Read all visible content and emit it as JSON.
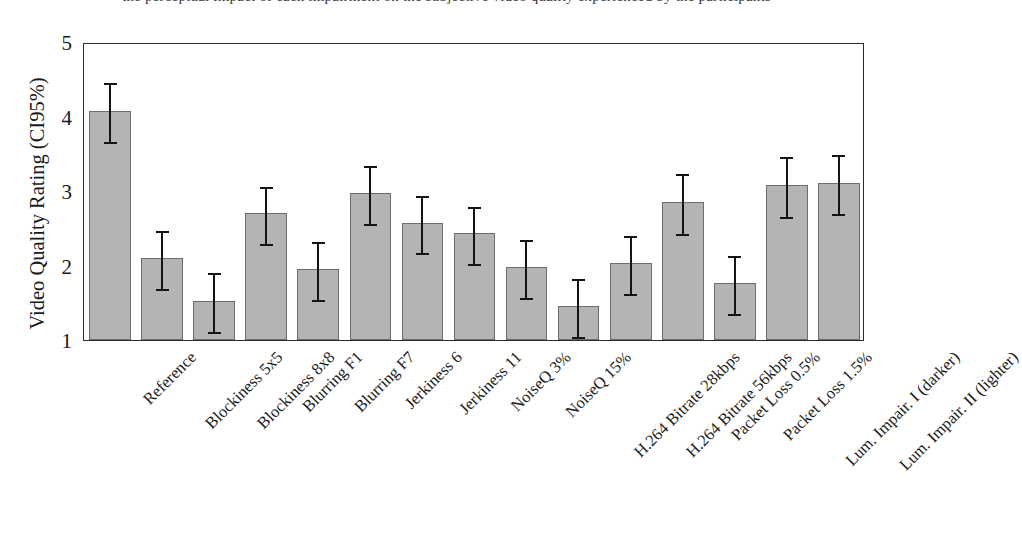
{
  "figure": {
    "top_clipped_caption": "the perceptual impact of each impairment on the subjective video quality experienced by the participants",
    "bar_color": "#b4b4b4",
    "bar_edge_color": "#6d6d6d",
    "errorbar_color": "#141414",
    "frame_color": "#2b2b2b",
    "background": "#ffffff"
  },
  "chart_data": {
    "type": "bar",
    "title": "",
    "xlabel": "",
    "ylabel": "Video Quality Rating (CI95%)",
    "ylim": [
      1,
      5
    ],
    "yticks": [
      1,
      2,
      3,
      4,
      5
    ],
    "ytick_labels": [
      "1",
      "2",
      "3",
      "4",
      "5"
    ],
    "grid": false,
    "legend": null,
    "error_type": "CI95%",
    "categories": [
      "Reference",
      "Blockiness 5x5",
      "Blockiness 8x8",
      "Blurring F1",
      "Blurring F7",
      "Jerkiness 6",
      "Jerkiness 11",
      "NoiseQ 3%",
      "NoiseQ 15%",
      "H.264 Bitrate 28kbps",
      "H.264 Bitrate 56kbps",
      "Packet Loss 0.5%",
      "Packet Loss 1.5%",
      "Lum. Impair. I (darker)",
      "Lum. Impair. II (lighter)"
    ],
    "values": [
      4.08,
      2.1,
      1.53,
      2.7,
      1.95,
      2.97,
      2.57,
      2.43,
      1.98,
      1.45,
      2.03,
      2.85,
      1.77,
      3.08,
      3.11
    ],
    "ci_lower": [
      3.69,
      1.71,
      1.14,
      2.31,
      1.56,
      2.58,
      2.19,
      2.05,
      1.59,
      1.07,
      1.64,
      2.45,
      1.38,
      2.68,
      2.72
    ],
    "ci_upper": [
      4.48,
      2.49,
      1.92,
      3.08,
      2.34,
      3.36,
      2.96,
      2.81,
      2.37,
      1.84,
      2.42,
      3.25,
      2.16,
      3.48,
      3.51
    ]
  }
}
